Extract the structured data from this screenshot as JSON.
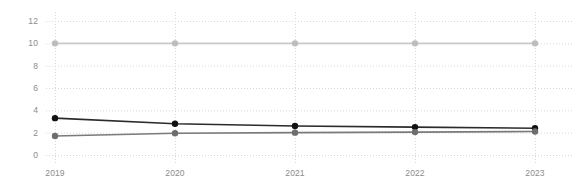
{
  "chart_data": {
    "type": "line",
    "title": "",
    "subtitle": "",
    "xlabel": "",
    "ylabel": "",
    "x": [
      2019,
      2020,
      2021,
      2022,
      2023
    ],
    "categories": [
      "2019",
      "2020",
      "2021",
      "2022",
      "2023"
    ],
    "xtick_labels": [
      "2019",
      "2020",
      "2021",
      "2022",
      "2023"
    ],
    "ytick_labels": [
      "0",
      "2",
      "4",
      "6",
      "8",
      "10",
      "12"
    ],
    "yticks": [
      0,
      2,
      4,
      6,
      8,
      10,
      12
    ],
    "ylim": [
      0,
      12
    ],
    "xlim": [
      2019,
      2023
    ],
    "grid": true,
    "grid_style": "dotted",
    "legend": false,
    "legend_position": "none",
    "markers": "circle",
    "series": [
      {
        "name": "series-light-gray",
        "color": "#c9c9c9",
        "marker_color": "#bdbdbd",
        "values": [
          10,
          10,
          10,
          10,
          10
        ]
      },
      {
        "name": "series-black",
        "color": "#2b2b2b",
        "marker_color": "#111111",
        "values": [
          3.3,
          2.8,
          2.6,
          2.5,
          2.4
        ]
      },
      {
        "name": "series-gray",
        "color": "#7a7a7a",
        "marker_color": "#6e6e6e",
        "values": [
          1.7,
          1.95,
          2.0,
          2.05,
          2.1
        ]
      }
    ]
  },
  "colors": {
    "background": "#ffffff",
    "grid": "#d8d8d8",
    "axis_text": "#8c8c8c",
    "series_light_gray": "#c9c9c9",
    "series_black": "#2b2b2b",
    "series_gray": "#7a7a7a"
  }
}
